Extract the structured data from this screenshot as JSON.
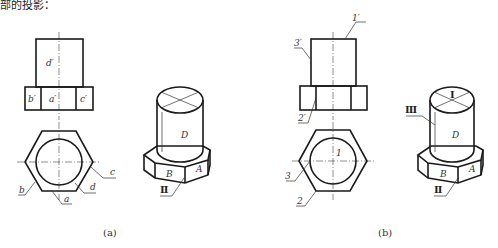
{
  "figure_a": {
    "caption": "(a)",
    "front_view_labels": {
      "top": "d′",
      "left": "b′",
      "mid": "a′",
      "right": "c′"
    },
    "top_view_labels": {
      "a": "a",
      "b": "b",
      "c": "c",
      "d": "d"
    },
    "iso_labels": {
      "face_top": "D",
      "face_left": "B",
      "face_right": "A",
      "edge": "Ⅱ"
    }
  },
  "figure_b": {
    "caption": "(b)",
    "front_view_labels": {
      "top_edge": "1′",
      "side_edge": "3′",
      "band_edge": "2′"
    },
    "top_view_labels": {
      "center": "1",
      "left": "3",
      "bottom": "2"
    },
    "iso_labels": {
      "top_mark": "Ⅰ",
      "side_mark": "Ⅲ",
      "face_top": "D",
      "face_left": "B",
      "face_right": "A",
      "edge": "Ⅱ"
    }
  },
  "header_fragment": "部的投影："
}
